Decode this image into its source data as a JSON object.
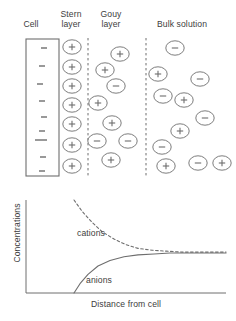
{
  "figure": {
    "stroke_color": "#6e6e6e",
    "text_color": "#3d3d3d",
    "background": "#ffffff"
  },
  "top_panel": {
    "headers": [
      {
        "id": "cell",
        "label": "Cell"
      },
      {
        "id": "stern",
        "label": "Stern\nlayer"
      },
      {
        "id": "gouy",
        "label": "Gouy\nlayer"
      },
      {
        "id": "bulk",
        "label": "Bulk solution"
      }
    ],
    "cell_box": {
      "x": 26,
      "y": 39,
      "width": 33,
      "height": 137,
      "charge": "-",
      "charge_count": 9
    },
    "cell_charges": [
      {
        "x": 44,
        "y": 48
      },
      {
        "x": 42,
        "y": 66
      },
      {
        "x": 40,
        "y": 84
      },
      {
        "x": 42,
        "y": 101
      },
      {
        "x": 44,
        "y": 117
      },
      {
        "x": 42,
        "y": 131
      },
      {
        "x": 38,
        "y": 140
      },
      {
        "x": 44,
        "y": 140
      },
      {
        "x": 43,
        "y": 157
      },
      {
        "x": 42,
        "y": 171
      }
    ],
    "dividers": [
      {
        "id": "stern-gouy",
        "x": 88,
        "y1": 38,
        "y2": 178
      },
      {
        "id": "gouy-bulk",
        "x": 146,
        "y1": 38,
        "y2": 178
      }
    ],
    "ions": [
      {
        "region": "stern",
        "sign": "+",
        "cx": 72,
        "cy": 47
      },
      {
        "region": "stern",
        "sign": "+",
        "cx": 72,
        "cy": 67
      },
      {
        "region": "stern",
        "sign": "+",
        "cx": 72,
        "cy": 86
      },
      {
        "region": "stern",
        "sign": "+",
        "cx": 72,
        "cy": 105
      },
      {
        "region": "stern",
        "sign": "+",
        "cx": 72,
        "cy": 124
      },
      {
        "region": "stern",
        "sign": "+",
        "cx": 72,
        "cy": 145
      },
      {
        "region": "stern",
        "sign": "+",
        "cx": 72,
        "cy": 166
      },
      {
        "region": "gouy",
        "sign": "+",
        "cx": 120,
        "cy": 54
      },
      {
        "region": "gouy",
        "sign": "+",
        "cx": 105,
        "cy": 70
      },
      {
        "region": "gouy",
        "sign": "-",
        "cx": 116,
        "cy": 86
      },
      {
        "region": "gouy",
        "sign": "+",
        "cx": 98,
        "cy": 103
      },
      {
        "region": "gouy",
        "sign": "+",
        "cx": 112,
        "cy": 123
      },
      {
        "region": "gouy",
        "sign": "-",
        "cx": 97,
        "cy": 141
      },
      {
        "region": "gouy",
        "sign": "-",
        "cx": 128,
        "cy": 141
      },
      {
        "region": "gouy",
        "sign": "+",
        "cx": 111,
        "cy": 160
      },
      {
        "region": "bulk",
        "sign": "-",
        "cx": 175,
        "cy": 48
      },
      {
        "region": "bulk",
        "sign": "+",
        "cx": 158,
        "cy": 74
      },
      {
        "region": "bulk",
        "sign": "-",
        "cx": 200,
        "cy": 79
      },
      {
        "region": "bulk",
        "sign": "-",
        "cx": 163,
        "cy": 96
      },
      {
        "region": "bulk",
        "sign": "+",
        "cx": 184,
        "cy": 100
      },
      {
        "region": "bulk",
        "sign": "-",
        "cx": 205,
        "cy": 118
      },
      {
        "region": "bulk",
        "sign": "+",
        "cx": 180,
        "cy": 131
      },
      {
        "region": "bulk",
        "sign": "-",
        "cx": 162,
        "cy": 147
      },
      {
        "region": "bulk",
        "sign": "+",
        "cx": 166,
        "cy": 166
      },
      {
        "region": "bulk",
        "sign": "-",
        "cx": 198,
        "cy": 163
      },
      {
        "region": "bulk",
        "sign": "+",
        "cx": 222,
        "cy": 163
      }
    ]
  },
  "chart_data": {
    "type": "line",
    "title": "",
    "xlabel": "Distance from cell",
    "ylabel": "Concentrations",
    "xlim": [
      0,
      1
    ],
    "ylim": [
      0,
      1
    ],
    "grid": false,
    "legend": "inline-annotations",
    "annotations": [
      {
        "text": "cations",
        "x": 0.27,
        "y": 0.7
      },
      {
        "text": "anions",
        "x": 0.32,
        "y": 0.22
      }
    ],
    "series": [
      {
        "name": "cations",
        "style": "dashed",
        "color": "#6e6e6e",
        "description": "Decays from high value near the cell to the bulk concentration",
        "x": [
          0.24,
          0.28,
          0.33,
          0.38,
          0.44,
          0.5,
          0.56,
          0.63,
          0.7,
          0.78,
          0.86,
          0.94,
          1.0
        ],
        "y": [
          1.0,
          0.88,
          0.76,
          0.66,
          0.58,
          0.52,
          0.48,
          0.46,
          0.45,
          0.44,
          0.44,
          0.44,
          0.44
        ]
      },
      {
        "name": "anions",
        "style": "solid",
        "color": "#6e6e6e",
        "description": "Rises from near zero at the cell to the bulk concentration",
        "x": [
          0.24,
          0.27,
          0.31,
          0.36,
          0.42,
          0.49,
          0.56,
          0.64,
          0.72,
          0.8,
          0.88,
          0.94,
          1.0
        ],
        "y": [
          0.0,
          0.1,
          0.2,
          0.29,
          0.35,
          0.39,
          0.41,
          0.42,
          0.43,
          0.43,
          0.43,
          0.43,
          0.43
        ]
      }
    ]
  }
}
